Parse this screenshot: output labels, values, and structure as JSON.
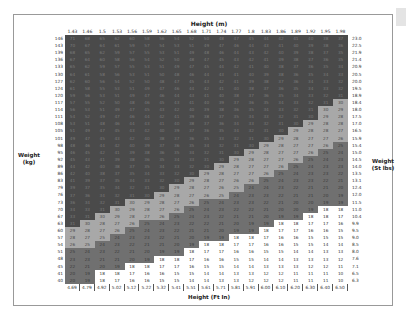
{
  "labels": {
    "top_axis": "Height (m)",
    "bottom_axis": "Height (Ft In)",
    "left_axis_1": "Weight",
    "left_axis_2": "(kg)",
    "right_axis_1": "Weight",
    "right_axis_2": "(St lbs)"
  },
  "colors": {
    "obese": "#4a4a4a",
    "normal": "#707070",
    "overweight": "#a8a8a8",
    "underweight": "#ffffff"
  },
  "chart_data": {
    "type": "heatmap",
    "xlabel_top": "Height (m)",
    "xlabel_bottom": "Height (Ft In)",
    "ylabel_left": "Weight (kg)",
    "ylabel_right": "Weight (St lbs)",
    "heights_m": [
      "1.43",
      "1.46",
      "1.5",
      "1.53",
      "1.56",
      "1.59",
      "1.62",
      "1.65",
      "1.68",
      "1.71",
      "1.74",
      "1.77",
      "1.8",
      "1.83",
      "1.86",
      "1.89",
      "1.92",
      "1.95",
      "1.98"
    ],
    "heights_ft": [
      "4.69",
      "4.79",
      "4.92",
      "5.02",
      "5.12",
      "5.22",
      "5.32",
      "5.41",
      "5.51",
      "5.61",
      "5.71",
      "5.81",
      "5.91",
      "6.00",
      "6.10",
      "6.20",
      "6.30",
      "6.40",
      "6.50"
    ],
    "weights_kg": [
      "146",
      "143",
      "139",
      "136",
      "133",
      "130",
      "127",
      "124",
      "120",
      "117",
      "114",
      "111",
      "108",
      "105",
      "101",
      "98",
      "95",
      "92",
      "89",
      "86",
      "83",
      "79",
      "76",
      "73",
      "70",
      "67",
      "63",
      "60",
      "57",
      "54",
      "51",
      "48",
      "45",
      "41",
      "40"
    ],
    "weights_st": [
      "23.0",
      "22.5",
      "21.9",
      "21.4",
      "20.9",
      "20.5",
      "20.0",
      "19.5",
      "18.9",
      "18.4",
      "18.0",
      "17.5",
      "17.0",
      "16.5",
      "15.9",
      "15.4",
      "15.0",
      "14.5",
      "14.0",
      "13.5",
      "13.1",
      "12.4",
      "12.0",
      "11.5",
      "11.0",
      "10.4",
      "9.9",
      "9.5",
      "9.0",
      "8.5",
      "8.0",
      "7.6",
      "7.1",
      "6.5",
      "6.3"
    ],
    "bands": [
      {
        "name": "underweight",
        "max": 18.5
      },
      {
        "name": "normal",
        "min": 18.5,
        "max": 25
      },
      {
        "name": "overweight",
        "min": 25,
        "max": 30
      },
      {
        "name": "obese",
        "min": 30
      }
    ],
    "values_note": "cell = round(weight_kg / height_m^2)"
  }
}
